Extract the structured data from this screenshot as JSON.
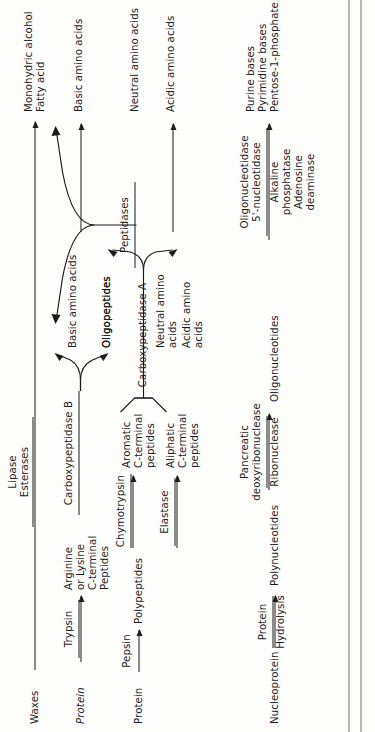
{
  "figure": {
    "kind": "digestion-enzyme-pathway",
    "orientation": "rotated-90-ccw",
    "rows": [
      {
        "id": "waxes",
        "substrate": "Waxes",
        "substrate_style": "roman",
        "enzymes": [
          "Lipase",
          "Esterases"
        ],
        "products": [
          "Monohydric alcohol",
          "Fatty acid"
        ]
      },
      {
        "id": "protein-1",
        "substrate": "Protein",
        "substrate_style": "italic",
        "enzymes": [
          "Trypsin"
        ],
        "intermediate": "Arginine\nor Lysine\nC-terminal\nPeptides",
        "stage2_enzyme": "Carboxypeptidase B",
        "stage2_products": [
          "Basic amino acids",
          "Oligopeptides"
        ],
        "final_products": [
          "Basic amino acids"
        ]
      },
      {
        "id": "protein-2",
        "substrate": "Protein",
        "substrate_style": "roman",
        "enzymes": [
          "Pepsin",
          "Chymotrypsin",
          "Elastase"
        ],
        "intermediates": [
          "Polypeptides",
          "Aromatic\nC-terminal\npeptides",
          "Aliphatic\nC-terminal\npeptides"
        ],
        "stage2_enzyme": "Carboxypeptidase A",
        "stage2_products": [
          "Oligopeptides",
          "Neutral amino\nacids",
          "Acidic amino\nacids"
        ],
        "stage3_enzyme": "Peptidases",
        "final_products": [
          "Neutral amino acids",
          "Acidic amino acids"
        ]
      },
      {
        "id": "nucleoprotein",
        "substrate": "Nucleoprotein",
        "substrate_style": "roman",
        "enzymes": [
          "Protein",
          "Hydrolysis"
        ],
        "intermediate": "Polynucleotides",
        "stage2_enzymes": [
          "Pancreatic",
          "deoxyribonuclease",
          "Ribonuclease"
        ],
        "stage2_product": "Oligonucleotides",
        "stage3_enzymes": [
          "Oligonucleotidase",
          "5'-nucleotidase",
          "Alkaline",
          "phosphatase",
          "Adenosine",
          "deaminase"
        ],
        "final_products": [
          "Purine bases",
          "Pyrimidine bases",
          "Pentose-1-phosphate"
        ]
      }
    ]
  },
  "substrates": {
    "waxes": "Waxes",
    "protein_italic": "Protein",
    "protein": "Protein",
    "nucleoprotein": "Nucleoprotein"
  },
  "enzymes": {
    "lipase": "Lipase",
    "esterases": "Esterases",
    "pepsin": "Pepsin",
    "trypsin": "Trypsin",
    "chymotrypsin": "Chymotrypsin",
    "elastase": "Elastase",
    "carboxypeptidase_a": "Carboxypeptidase A",
    "carboxypeptidase_b": "Carboxypeptidase B",
    "peptidases": "Peptidases",
    "protein_hydrolysis_top": "Protein",
    "protein_hydrolysis_bottom": "Hydrolysis",
    "pancreatic": "Pancreatic",
    "deoxyribonuclease": "deoxyribonuclease",
    "ribonuclease": "Ribonuclease",
    "oligonucleotidase": "Oligonucleotidase",
    "five_nucleotidase": "5'-nucleotidase",
    "alkaline": "Alkaline",
    "phosphatase": "phosphatase",
    "adenosine": "Adenosine",
    "deaminase": "deaminase"
  },
  "intermediates": {
    "arginine_lysine": "Arginine\nor Lysine\nC-terminal\nPeptides",
    "aromatic": "Aromatic\nC-terminal\npeptides",
    "aliphatic": "Aliphatic\nC-terminal\npeptides",
    "polypeptides": "Polypeptides",
    "polynucleotides": "Polynucleotides",
    "oligopeptides_b": "Oligopeptides",
    "oligopeptides_a": "Oligopeptides",
    "basic_amino_acids_mid": "Basic amino acids",
    "neutral_amino_acids_mid": "Neutral amino\nacids",
    "acidic_amino_acids_mid": "Acidic amino\nacids",
    "oligonucleotides": "Oligonucleotides"
  },
  "products": {
    "monohydric_alcohol": "Monohydric alcohol",
    "fatty_acid": "Fatty acid",
    "basic_amino_acids": "Basic amino acids",
    "neutral_amino_acids": "Neutral amino acids",
    "acidic_amino_acids": "Acidic amino acids",
    "purine_bases": "Purine bases",
    "pyrimidine_bases": "Pyrimidine bases",
    "pentose_1_phosphate": "Pentose-1-phosphate"
  },
  "colors": {
    "ink": "#1b1b1b",
    "paper": "#fdfdfc",
    "frame": "#6f6f6f"
  }
}
